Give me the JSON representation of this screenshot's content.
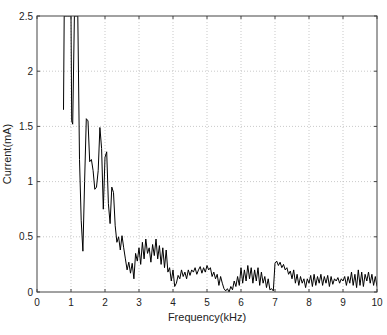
{
  "chart_data": {
    "type": "line",
    "title": "",
    "xlabel": "Frequency(kHz)",
    "ylabel": "Current(mA)",
    "xlim": [
      0,
      10
    ],
    "ylim": [
      0,
      2.5
    ],
    "xticks": [
      0,
      1,
      2,
      3,
      4,
      5,
      6,
      7,
      8,
      9,
      10
    ],
    "yticks": [
      0,
      0.5,
      1,
      1.5,
      2,
      2.5
    ],
    "grid": true,
    "legend": null,
    "series": [
      {
        "name": "current",
        "color": "#000000",
        "x": [
          0.78,
          0.8,
          0.85,
          0.9,
          0.95,
          1.0,
          1.02,
          1.05,
          1.1,
          1.15,
          1.2,
          1.25,
          1.3,
          1.35,
          1.4,
          1.45,
          1.5,
          1.55,
          1.6,
          1.65,
          1.7,
          1.75,
          1.8,
          1.85,
          1.9,
          1.95,
          2.0,
          2.05,
          2.1,
          2.15,
          2.2,
          2.25,
          2.3,
          2.35,
          2.4,
          2.45,
          2.5,
          2.55,
          2.6,
          2.65,
          2.7,
          2.75,
          2.8,
          2.85,
          2.9,
          2.95,
          3.0,
          3.05,
          3.1,
          3.15,
          3.2,
          3.25,
          3.3,
          3.35,
          3.4,
          3.45,
          3.5,
          3.55,
          3.6,
          3.65,
          3.7,
          3.75,
          3.8,
          3.85,
          3.9,
          3.95,
          4.0,
          4.05,
          4.1,
          4.15,
          4.2,
          4.25,
          4.3,
          4.35,
          4.4,
          4.45,
          4.5,
          4.55,
          4.6,
          4.65,
          4.7,
          4.75,
          4.8,
          4.85,
          4.9,
          4.95,
          5.0,
          5.05,
          5.1,
          5.15,
          5.2,
          5.25,
          5.3,
          5.35,
          5.4,
          5.45,
          5.5,
          5.55,
          5.6,
          5.65,
          5.7,
          5.75,
          5.8,
          5.85,
          5.9,
          5.95,
          6.0,
          6.05,
          6.1,
          6.15,
          6.2,
          6.25,
          6.3,
          6.35,
          6.4,
          6.45,
          6.5,
          6.55,
          6.6,
          6.65,
          6.7,
          6.75,
          6.8,
          6.85,
          6.9,
          6.95,
          7.0,
          7.05,
          7.1,
          7.15,
          7.2,
          7.25,
          7.3,
          7.35,
          7.4,
          7.45,
          7.5,
          7.55,
          7.6,
          7.65,
          7.7,
          7.75,
          7.8,
          7.85,
          7.9,
          7.95,
          8.0,
          8.05,
          8.1,
          8.15,
          8.2,
          8.25,
          8.3,
          8.35,
          8.4,
          8.45,
          8.5,
          8.55,
          8.6,
          8.65,
          8.7,
          8.75,
          8.8,
          8.85,
          8.9,
          8.95,
          9.0,
          9.05,
          9.1,
          9.15,
          9.2,
          9.25,
          9.3,
          9.35,
          9.4,
          9.45,
          9.5,
          9.55,
          9.6,
          9.65,
          9.7,
          9.75,
          9.8,
          9.85,
          9.9,
          9.95,
          10.0
        ],
        "y": [
          1.65,
          2.5,
          2.5,
          2.5,
          2.5,
          2.5,
          1.55,
          1.52,
          2.5,
          2.5,
          2.5,
          1.2,
          0.65,
          0.37,
          1.0,
          1.57,
          1.55,
          1.18,
          1.2,
          1.1,
          0.93,
          0.95,
          1.1,
          1.49,
          1.3,
          0.75,
          1.22,
          1.27,
          0.8,
          0.62,
          0.95,
          0.9,
          0.6,
          0.45,
          0.5,
          0.38,
          0.51,
          0.4,
          0.3,
          0.2,
          0.27,
          0.17,
          0.26,
          0.12,
          0.35,
          0.28,
          0.4,
          0.25,
          0.45,
          0.3,
          0.48,
          0.35,
          0.4,
          0.27,
          0.43,
          0.33,
          0.48,
          0.3,
          0.42,
          0.25,
          0.4,
          0.22,
          0.38,
          0.18,
          0.22,
          0.1,
          0.2,
          0.05,
          0.08,
          0.15,
          0.12,
          0.2,
          0.14,
          0.18,
          0.12,
          0.2,
          0.15,
          0.2,
          0.18,
          0.22,
          0.16,
          0.2,
          0.23,
          0.17,
          0.22,
          0.18,
          0.24,
          0.2,
          0.22,
          0.14,
          0.18,
          0.12,
          0.16,
          0.06,
          0.14,
          0.08,
          0.03,
          0.01,
          0.03,
          0.0,
          0.05,
          0.02,
          0.1,
          0.05,
          0.14,
          0.06,
          0.22,
          0.08,
          0.2,
          0.1,
          0.24,
          0.12,
          0.22,
          0.08,
          0.2,
          0.1,
          0.22,
          0.06,
          0.18,
          0.08,
          0.14,
          0.04,
          0.12,
          0.02,
          0.03,
          0.01,
          0.26,
          0.28,
          0.24,
          0.27,
          0.22,
          0.25,
          0.2,
          0.22,
          0.16,
          0.19,
          0.12,
          0.2,
          0.08,
          0.16,
          0.06,
          0.14,
          0.08,
          0.12,
          0.04,
          0.12,
          0.08,
          0.15,
          0.05,
          0.16,
          0.06,
          0.14,
          0.08,
          0.16,
          0.06,
          0.14,
          0.08,
          0.15,
          0.05,
          0.14,
          0.07,
          0.12,
          0.1,
          0.13,
          0.08,
          0.12,
          0.1,
          0.14,
          0.06,
          0.14,
          0.08,
          0.18,
          0.06,
          0.16,
          0.04,
          0.2,
          0.06,
          0.18,
          0.05,
          0.16,
          0.1,
          0.18,
          0.08,
          0.16,
          0.06,
          0.14,
          0.05
        ]
      }
    ]
  },
  "plot": {
    "left": 37,
    "right": 377,
    "top": 16,
    "bottom": 292
  }
}
